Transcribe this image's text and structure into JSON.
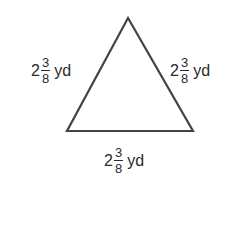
{
  "figure": {
    "shape": "equilateral-triangle",
    "stroke_color": "#444444",
    "vertices": {
      "apex": [
        128,
        18
      ],
      "bottom_left": [
        67,
        131
      ],
      "bottom_right": [
        193,
        131
      ]
    },
    "sides": {
      "left": {
        "whole": "2",
        "numerator": "3",
        "denominator": "8",
        "unit": "yd"
      },
      "right": {
        "whole": "2",
        "numerator": "3",
        "denominator": "8",
        "unit": "yd"
      },
      "bottom": {
        "whole": "2",
        "numerator": "3",
        "denominator": "8",
        "unit": "yd"
      }
    }
  }
}
